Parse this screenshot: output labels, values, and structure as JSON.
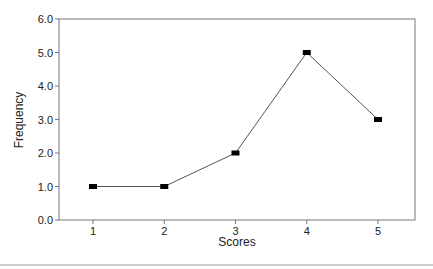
{
  "chart_data": {
    "type": "line",
    "title": "",
    "xlabel": "Scores",
    "ylabel": "Frequency",
    "categories": [
      "1",
      "2",
      "3",
      "4",
      "5"
    ],
    "x": [
      1,
      2,
      3,
      4,
      5
    ],
    "values": [
      1.0,
      1.0,
      2.0,
      5.0,
      3.0
    ],
    "ylim": [
      0,
      6
    ],
    "yticks": [
      "0.0",
      "1.0",
      "2.0",
      "3.0",
      "4.0",
      "5.0",
      "6.0"
    ],
    "xticks": [
      "1",
      "2",
      "3",
      "4",
      "5"
    ],
    "grid": false,
    "legend": null,
    "marker": "square",
    "line_color": "#555555",
    "marker_color": "#000000"
  }
}
